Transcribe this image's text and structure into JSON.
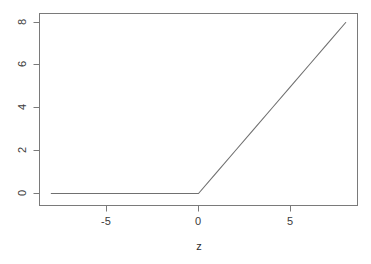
{
  "chart_data": {
    "type": "line",
    "title": "",
    "subtitle": "",
    "xlabel": "z",
    "ylabel": "",
    "xlim": [
      -8,
      8
    ],
    "ylim": [
      -0.1,
      8
    ],
    "grid": false,
    "legend": null,
    "x_ticks": [
      -5,
      0,
      5
    ],
    "x_tick_labels": [
      "-5",
      "0",
      "5"
    ],
    "y_ticks": [
      0,
      2,
      4,
      6,
      8
    ],
    "y_tick_labels": [
      "0",
      "2",
      "4",
      "6",
      "8"
    ],
    "y_tick_rotation": -90,
    "line_color": "#707070",
    "axis_color": "#7a7a7a",
    "box": true,
    "series": [
      {
        "name": "relu",
        "x": [
          -8,
          -7,
          -6,
          -5,
          -4,
          -3,
          -2,
          -1,
          0,
          1,
          2,
          3,
          4,
          5,
          6,
          7,
          8
        ],
        "values": [
          0,
          0,
          0,
          0,
          0,
          0,
          0,
          0,
          0,
          1,
          2,
          3,
          4,
          5,
          6,
          7,
          8
        ]
      }
    ]
  },
  "labels": {
    "y8": "8",
    "y6": "6",
    "y4": "4",
    "y2": "2",
    "y0": "0",
    "xm5": "-5",
    "x0": "0",
    "x5": "5",
    "xtitle": "z"
  }
}
